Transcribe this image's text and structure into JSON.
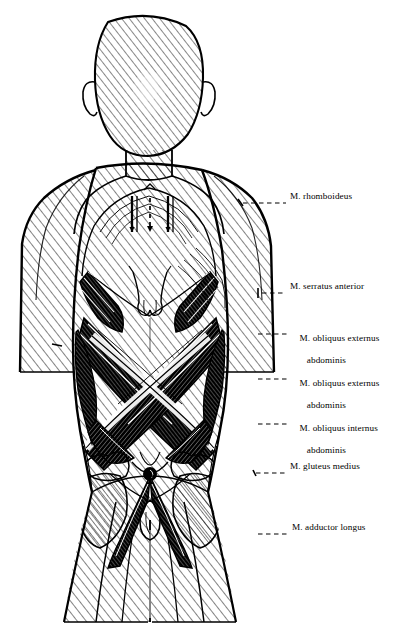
{
  "figure": {
    "kind": "anatomical-illustration",
    "style": "pen-and-ink hatched line drawing",
    "background_color": "#ffffff",
    "ink_color": "#000000",
    "view": "posterior (back) view of headless-hatched human figure, arms cut at mid-upper-arm, legs cut at mid-thigh"
  },
  "labels": [
    {
      "id": "rhomboideus",
      "text": "M. rhomboideus",
      "lines": [
        "M. rhomboideus"
      ],
      "text_x": 290,
      "text_y": 197,
      "leader": {
        "x1": 243,
        "y1": 203,
        "x2": 286,
        "y2": 203,
        "style": "dashed"
      }
    },
    {
      "id": "serratus-anterior",
      "text": "M. serratus anterior",
      "lines": [
        "M. serratus anterior"
      ],
      "text_x": 290,
      "text_y": 287,
      "leader": {
        "x1": 262,
        "y1": 293,
        "x2": 286,
        "y2": 293,
        "style": "dashed"
      }
    },
    {
      "id": "obliquus-externus-abdominis-1",
      "text": "M. obliquus externus abdominis",
      "lines": [
        "M. obliquus externus",
        "   abdominis"
      ],
      "text_x": 290,
      "text_y": 328,
      "leader": {
        "x1": 258,
        "y1": 334,
        "x2": 288,
        "y2": 334,
        "style": "dashed"
      }
    },
    {
      "id": "obliquus-externus-abdominis-2",
      "text": "M. obliquus externus abdominis",
      "lines": [
        "M. obliquus externus",
        "   abdominis"
      ],
      "text_x": 290,
      "text_y": 373,
      "leader": {
        "x1": 258,
        "y1": 379,
        "x2": 288,
        "y2": 379,
        "style": "dashed"
      }
    },
    {
      "id": "obliquus-internus-abdominis",
      "text": "M. obliquus internus abdominis",
      "lines": [
        "M. obliquus internus",
        "   abdominis"
      ],
      "text_x": 290,
      "text_y": 418,
      "leader": {
        "x1": 258,
        "y1": 424,
        "x2": 288,
        "y2": 424,
        "style": "dashed"
      }
    },
    {
      "id": "gluteus-medius",
      "text": "M. gluteus medius",
      "lines": [
        "M. gluteus medius"
      ],
      "text_x": 290,
      "text_y": 467,
      "leader": {
        "x1": 256,
        "y1": 473,
        "x2": 288,
        "y2": 473,
        "style": "dashed"
      }
    },
    {
      "id": "adductor-longus",
      "text": "M. adductor longus",
      "lines": [
        "M. adductor longus"
      ],
      "text_x": 292,
      "text_y": 528,
      "leader": {
        "x1": 258,
        "y1": 534,
        "x2": 288,
        "y2": 534,
        "style": "dashed"
      }
    }
  ]
}
